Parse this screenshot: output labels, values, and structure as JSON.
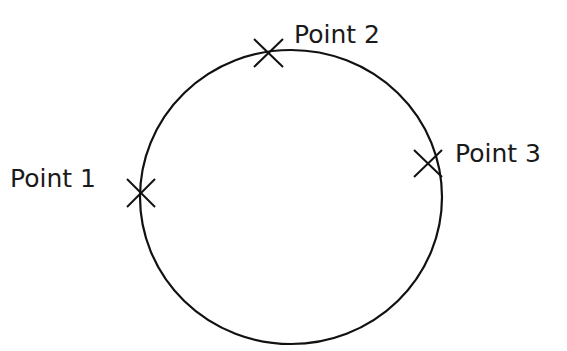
{
  "diagram": {
    "type": "circle-through-three-points",
    "circle": {
      "cx": 291,
      "cy": 197,
      "rx": 151,
      "ry": 147,
      "stroke": "#111111"
    },
    "points": [
      {
        "label": "Point 1",
        "x": 141,
        "y": 193,
        "label_x": 10,
        "label_y": 187
      },
      {
        "label": "Point 2",
        "x": 268,
        "y": 53,
        "label_x": 294,
        "label_y": 43
      },
      {
        "label": "Point 3",
        "x": 428,
        "y": 163,
        "label_x": 455,
        "label_y": 162
      }
    ]
  }
}
